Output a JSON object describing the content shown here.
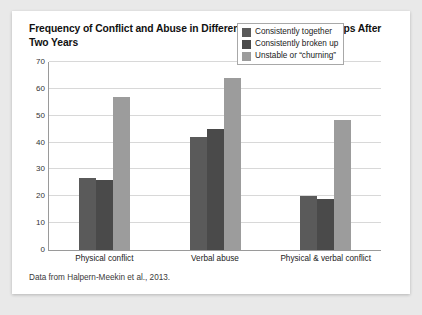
{
  "card": {
    "title": "Frequency of Conflict and Abuse in Different Types of Relationships After Two Years",
    "source": "Data from Halpern-Meekin et al., 2013."
  },
  "colors": {
    "series_1": "#5a5a5a",
    "series_2": "#4a4a4a",
    "series_3": "#9c9c9c",
    "grid": "#d8d8d8",
    "axis": "#9a9a9a",
    "card_background": "#ffffff",
    "page_background": "#e9e9e9"
  },
  "chart_data": {
    "type": "bar",
    "title": "Frequency of Conflict and Abuse in Different Types of Relationships After Two Years",
    "xlabel": "",
    "ylabel": "",
    "ylim": [
      0,
      70
    ],
    "yticks": [
      0,
      10,
      20,
      30,
      40,
      50,
      60,
      70
    ],
    "grid": true,
    "legend_position": "top-right",
    "categories": [
      "Physical conflict",
      "Verbal abuse",
      "Physical & verbal conflict"
    ],
    "series": [
      {
        "name": "Consistently together",
        "values": [
          27,
          42,
          20
        ]
      },
      {
        "name": "Consistently broken up",
        "values": [
          26,
          45,
          19
        ]
      },
      {
        "name": "Unstable or “churning”",
        "values": [
          57,
          64,
          48.5
        ]
      }
    ],
    "annotation": "Data from Halpern-Meekin et al., 2013."
  }
}
